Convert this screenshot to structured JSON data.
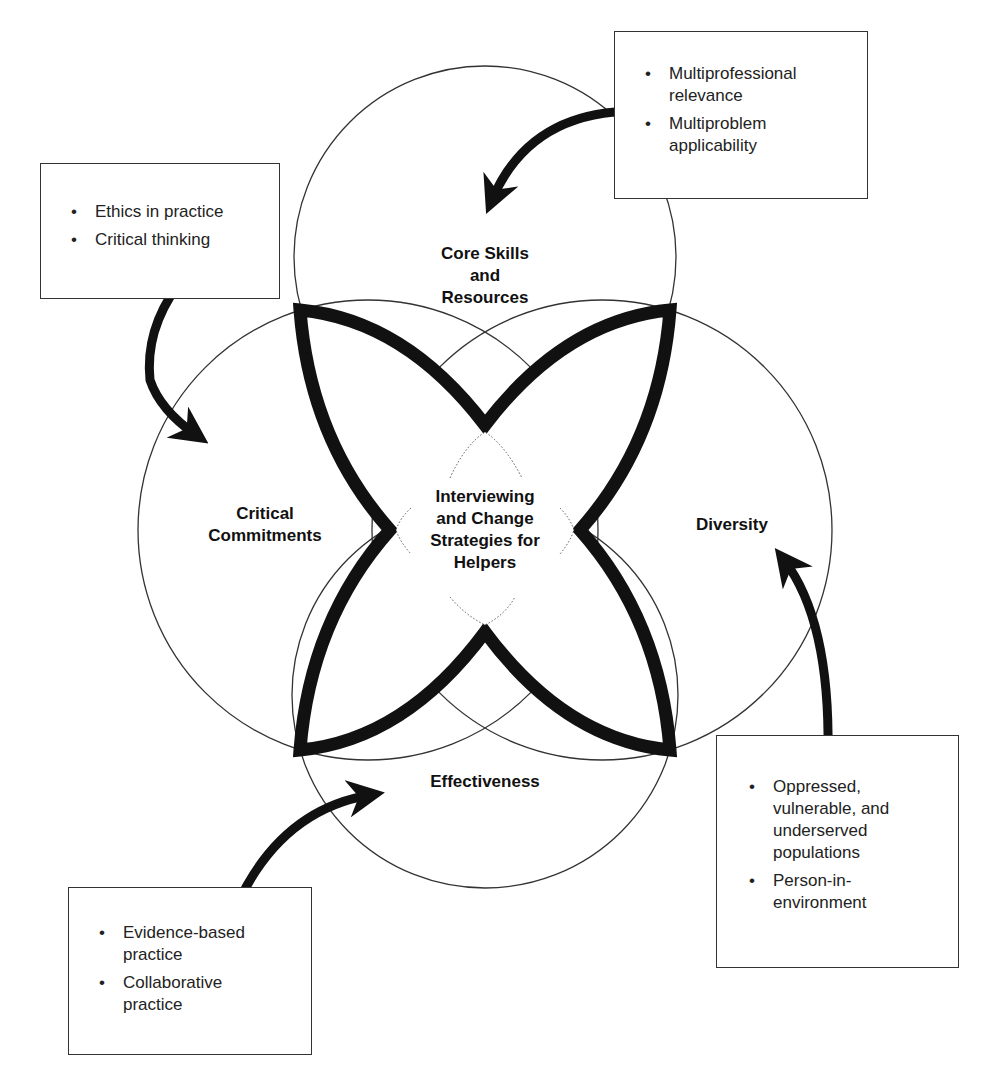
{
  "diagram": {
    "center_label": "Interviewing and Change Strategies for Helpers",
    "center_lines": [
      "Interviewing",
      "and Change",
      "Strategies for",
      "Helpers"
    ],
    "circles": [
      {
        "id": "top",
        "lines": [
          "Core Skills",
          "and",
          "Resources"
        ]
      },
      {
        "id": "left",
        "lines": [
          "Critical",
          "Commitments"
        ]
      },
      {
        "id": "right",
        "lines": [
          "Diversity"
        ]
      },
      {
        "id": "bottom",
        "lines": [
          "Effectiveness"
        ]
      }
    ],
    "boxes": [
      {
        "id": "top-right",
        "target": "Core Skills and Resources",
        "items": [
          [
            "Multiprofessional",
            "relevance"
          ],
          [
            "Multiproblem",
            "applicability"
          ]
        ]
      },
      {
        "id": "top-left",
        "target": "Critical Commitments",
        "items": [
          [
            "Ethics in practice"
          ],
          [
            "Critical thinking"
          ]
        ]
      },
      {
        "id": "bottom-right",
        "target": "Diversity",
        "items": [
          [
            "Oppressed,",
            "vulnerable, and",
            "underserved",
            "populations"
          ],
          [
            "Person-in-",
            "environment"
          ]
        ]
      },
      {
        "id": "bottom-left",
        "target": "Effectiveness",
        "items": [
          [
            "Evidence-based",
            "practice"
          ],
          [
            "Collaborative",
            "practice"
          ]
        ]
      }
    ],
    "bullet_glyph": "•",
    "colors": {
      "stroke": "#111111",
      "thin_line": "#333333",
      "background": "#ffffff"
    }
  }
}
